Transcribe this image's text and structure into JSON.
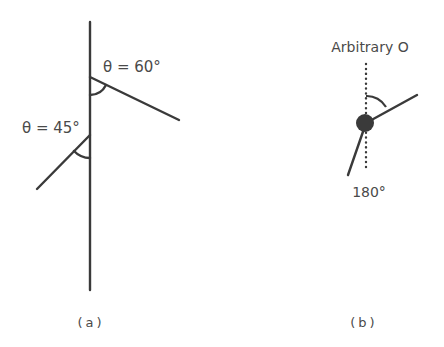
{
  "panel_a": {
    "angle_60_label": "θ = 60°",
    "angle_45_label": "θ = 45°",
    "caption": "(a)"
  },
  "panel_b": {
    "top_label": "Arbitrary O",
    "bottom_label": "180°",
    "caption": "(b)"
  },
  "colors": {
    "line": "#3a3a3a",
    "text": "#4a4a4a",
    "background": "#ffffff"
  }
}
